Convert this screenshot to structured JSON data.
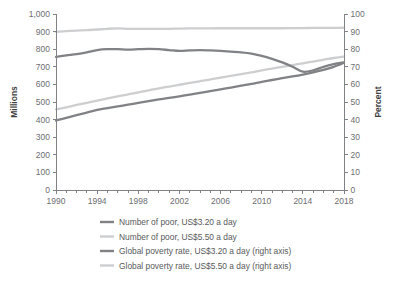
{
  "chart_data": {
    "type": "line",
    "title": "",
    "xlabel": "",
    "ylabel": "Millions",
    "y2label": "Percent",
    "x": [
      1990,
      1991,
      1992,
      1993,
      1994,
      1995,
      1996,
      1997,
      1998,
      1999,
      2000,
      2001,
      2002,
      2003,
      2004,
      2005,
      2006,
      2007,
      2008,
      2009,
      2010,
      2011,
      2012,
      2013,
      2014,
      2015,
      2016,
      2017,
      2018
    ],
    "xlim": [
      1990,
      2018
    ],
    "ylim": [
      0,
      1000
    ],
    "y2lim": [
      0,
      100
    ],
    "xticks": [
      1990,
      1994,
      1998,
      2002,
      2006,
      2010,
      2014,
      2018
    ],
    "xtick_labels": [
      "1990",
      "1994",
      "1998",
      "2002",
      "2006",
      "2010",
      "2014",
      "2018"
    ],
    "x_minor_tick_step": 1,
    "yticks": [
      0,
      100,
      200,
      300,
      400,
      500,
      600,
      700,
      800,
      900,
      1000
    ],
    "ytick_labels": [
      "0",
      "100",
      "200",
      "300",
      "400",
      "500",
      "600",
      "700",
      "800",
      "900",
      "1,000"
    ],
    "y2ticks": [
      0,
      10,
      20,
      30,
      40,
      50,
      60,
      70,
      80,
      90,
      100
    ],
    "y2tick_labels": [
      "0",
      "10",
      "20",
      "30",
      "40",
      "50",
      "60",
      "70",
      "80",
      "90",
      "100"
    ],
    "grid": false,
    "legend_position": "bottom",
    "series": [
      {
        "name": "Number of poor, US$3.20 a day",
        "axis": "left",
        "color": "#808285",
        "width": 2.3,
        "values": [
          757,
          765,
          772,
          782,
          795,
          800,
          800,
          798,
          800,
          802,
          800,
          795,
          790,
          793,
          795,
          793,
          790,
          786,
          782,
          775,
          762,
          745,
          725,
          700,
          672,
          680,
          700,
          715,
          725
        ]
      },
      {
        "name": "Number of poor, US$5.50 a day",
        "axis": "left",
        "color": "#cdced0",
        "width": 2.3,
        "values": [
          898,
          903,
          906,
          908,
          912,
          916,
          918,
          916,
          915,
          915,
          916,
          916,
          917,
          918,
          918,
          918,
          919,
          919,
          919,
          919,
          919,
          919,
          919,
          920,
          920,
          921,
          921,
          921,
          922
        ]
      },
      {
        "name": "Global poverty rate, US$3.20 a day (right axis)",
        "axis": "right",
        "color": "#808285",
        "width": 2.3,
        "values": [
          39.5,
          41.0,
          42.5,
          44.0,
          45.5,
          46.5,
          47.5,
          48.5,
          49.5,
          50.5,
          51.5,
          52.3,
          53.2,
          54.2,
          55.2,
          56.2,
          57.2,
          58.2,
          59.3,
          60.3,
          61.5,
          62.5,
          63.5,
          64.5,
          65.6,
          66.8,
          68.2,
          70.0,
          72.3
        ]
      },
      {
        "name": "Global poverty rate, US$5.50 a day (right axis)",
        "axis": "right",
        "color": "#cdced0",
        "width": 2.3,
        "values": [
          45.8,
          47.0,
          48.3,
          49.5,
          50.8,
          52.0,
          53.2,
          54.3,
          55.5,
          56.6,
          57.8,
          58.8,
          59.8,
          60.8,
          61.8,
          62.8,
          63.8,
          64.8,
          65.8,
          66.8,
          68.0,
          69.0,
          70.0,
          71.0,
          72.0,
          73.0,
          74.0,
          75.0,
          75.8
        ]
      }
    ],
    "legend": [
      {
        "label": "Number of poor, US$3.20 a day",
        "color": "#808285"
      },
      {
        "label": "Number of poor, US$5.50 a day",
        "color": "#cdced0"
      },
      {
        "label": "Global poverty rate, US$3.20 a day (right axis)",
        "color": "#808285"
      },
      {
        "label": "Global poverty rate, US$5.50 a day (right axis)",
        "color": "#cdced0"
      }
    ]
  },
  "axes": {
    "left_title": "Millions",
    "right_title": "Percent"
  }
}
